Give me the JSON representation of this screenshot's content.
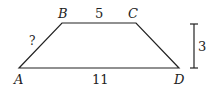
{
  "diagram": {
    "type": "trapezoid",
    "vertices": {
      "A": {
        "label": "A",
        "x": 19,
        "y": 68
      },
      "B": {
        "label": "B",
        "x": 62,
        "y": 23
      },
      "C": {
        "label": "C",
        "x": 136,
        "y": 23
      },
      "D": {
        "label": "D",
        "x": 179,
        "y": 68
      }
    },
    "side_labels": {
      "top_BC": "5",
      "bottom_AD": "11",
      "left_AB": "?",
      "height": "3"
    },
    "colors": {
      "stroke": "#222222",
      "background": "#ffffff"
    }
  }
}
